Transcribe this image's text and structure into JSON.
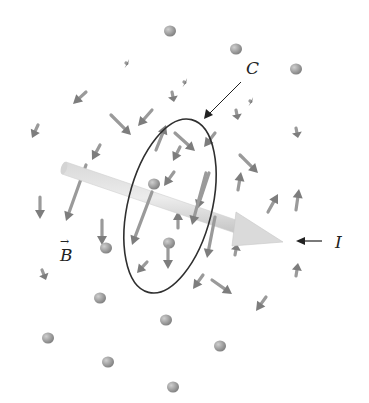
{
  "labels": {
    "curve": "C",
    "current": "I",
    "field": "B",
    "vector_mark": "→"
  },
  "colors": {
    "arrow": "#9a9a9a",
    "arrow_dark": "#7d7d7d",
    "wire": "#c8c8c8",
    "wire_light": "#e4e4e4",
    "loop": "#2f2f2f",
    "text": "#222222"
  },
  "field_arrows": [
    {
      "x": 170,
      "y": 31,
      "dx": 0,
      "dy": 0
    },
    {
      "x": 236,
      "y": 49,
      "dx": 0,
      "dy": 0
    },
    {
      "x": 296,
      "y": 69,
      "dx": 0,
      "dy": 0
    },
    {
      "x": 126,
      "y": 63,
      "dx": 2,
      "dy": 1
    },
    {
      "x": 184,
      "y": 82,
      "dx": 2,
      "dy": 1
    },
    {
      "x": 250,
      "y": 101,
      "dx": 2,
      "dy": 1
    },
    {
      "x": 86,
      "y": 92,
      "dx": -13,
      "dy": 12
    },
    {
      "x": 38,
      "y": 125,
      "dx": -6,
      "dy": 13
    },
    {
      "x": 172,
      "y": 92,
      "dx": 2,
      "dy": 10
    },
    {
      "x": 236,
      "y": 110,
      "dx": 2,
      "dy": 10
    },
    {
      "x": 296,
      "y": 128,
      "dx": 2,
      "dy": 10
    },
    {
      "x": 111,
      "y": 115,
      "dx": 20,
      "dy": 20
    },
    {
      "x": 152,
      "y": 110,
      "dx": -14,
      "dy": 16
    },
    {
      "x": 175,
      "y": 133,
      "dx": 20,
      "dy": 18
    },
    {
      "x": 215,
      "y": 133,
      "dx": -11,
      "dy": 14
    },
    {
      "x": 240,
      "y": 155,
      "dx": 18,
      "dy": 18
    },
    {
      "x": 100,
      "y": 145,
      "dx": -8,
      "dy": 15
    },
    {
      "x": 156,
      "y": 150,
      "dx": 10,
      "dy": -25
    },
    {
      "x": 180,
      "y": 147,
      "dx": -7,
      "dy": 14
    },
    {
      "x": 174,
      "y": 172,
      "dx": -10,
      "dy": 14
    },
    {
      "x": 209,
      "y": 173,
      "dx": -12,
      "dy": 36
    },
    {
      "x": 238,
      "y": 190,
      "dx": 3,
      "dy": -18
    },
    {
      "x": 268,
      "y": 212,
      "dx": 10,
      "dy": -18
    },
    {
      "x": 296,
      "y": 210,
      "dx": 3,
      "dy": -21
    },
    {
      "x": 86,
      "y": 165,
      "dx": -20,
      "dy": 56
    },
    {
      "x": 40,
      "y": 197,
      "dx": 0,
      "dy": 22
    },
    {
      "x": 152,
      "y": 192,
      "dx": -20,
      "dy": 53
    },
    {
      "x": 206,
      "y": 173,
      "dx": -14,
      "dy": 52
    },
    {
      "x": 102,
      "y": 220,
      "dx": 0,
      "dy": 25
    },
    {
      "x": 154,
      "y": 184,
      "dx": 0,
      "dy": 0
    },
    {
      "x": 169,
      "y": 243,
      "dx": 0,
      "dy": 0
    },
    {
      "x": 178,
      "y": 228,
      "dx": 0,
      "dy": -17
    },
    {
      "x": 168,
      "y": 246,
      "dx": 0,
      "dy": 23
    },
    {
      "x": 147,
      "y": 262,
      "dx": -10,
      "dy": 11
    },
    {
      "x": 215,
      "y": 217,
      "dx": -8,
      "dy": 41
    },
    {
      "x": 235,
      "y": 255,
      "dx": 2,
      "dy": -11
    },
    {
      "x": 296,
      "y": 276,
      "dx": 2,
      "dy": -13
    },
    {
      "x": 106,
      "y": 248,
      "dx": 0,
      "dy": 0
    },
    {
      "x": 203,
      "y": 275,
      "dx": -10,
      "dy": 14
    },
    {
      "x": 212,
      "y": 280,
      "dx": 20,
      "dy": 14
    },
    {
      "x": 266,
      "y": 297,
      "dx": -10,
      "dy": 14
    },
    {
      "x": 42,
      "y": 270,
      "dx": 4,
      "dy": 10
    },
    {
      "x": 100,
      "y": 298,
      "dx": 0,
      "dy": 0
    },
    {
      "x": 166,
      "y": 320,
      "dx": 0,
      "dy": 0
    },
    {
      "x": 220,
      "y": 346,
      "dx": 0,
      "dy": 0
    },
    {
      "x": 48,
      "y": 338,
      "dx": 0,
      "dy": 0
    },
    {
      "x": 108,
      "y": 362,
      "dx": 0,
      "dy": 0
    },
    {
      "x": 173,
      "y": 387,
      "dx": 0,
      "dy": 0
    }
  ]
}
